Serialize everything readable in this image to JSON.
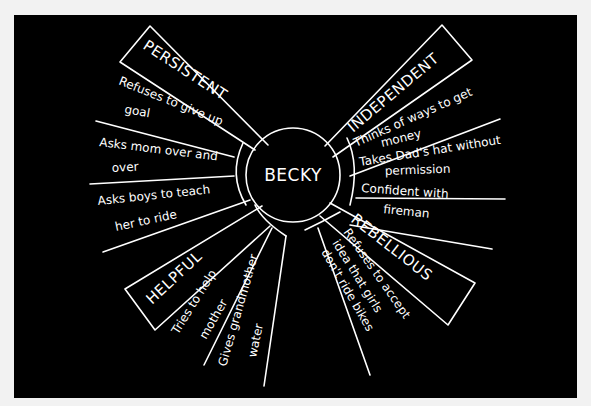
{
  "center": {
    "label": "BECKY"
  },
  "categories": [
    {
      "name": "PERSISTENT",
      "traits": [
        {
          "line1": "Refuses to give up",
          "line2": "goal"
        },
        {
          "line1": "Asks mom over and",
          "line2": "over"
        },
        {
          "line1": "Asks boys to teach",
          "line2": "her to ride"
        }
      ]
    },
    {
      "name": "INDEPENDENT",
      "traits": [
        {
          "line1": "Thinks of ways to get",
          "line2": "money"
        },
        {
          "line1": "Takes Dad's hat without",
          "line2": "permission"
        },
        {
          "line1": "Confident with",
          "line2": "fireman"
        }
      ]
    },
    {
      "name": "HELPFUL",
      "traits": [
        {
          "line1": "Tries to help",
          "line2": "mother"
        },
        {
          "line1": "Gives grandmother",
          "line2": "water"
        }
      ]
    },
    {
      "name": "REBELLIOUS",
      "traits": [
        {
          "line1": "Refuses to accept",
          "line2": "idea that girls",
          "line3": "don't ride bikes"
        }
      ]
    }
  ],
  "colors": {
    "background": "#000000",
    "stroke": "#ffffff",
    "page": "#f2f2f2"
  }
}
